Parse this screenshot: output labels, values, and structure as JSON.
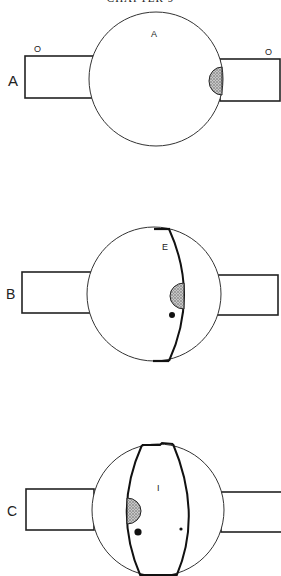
{
  "header": {
    "title": "CHAPTER 9"
  },
  "colors": {
    "ink": "#222222",
    "stipple": "#9a9a9a",
    "background": "#ffffff"
  },
  "figures": [
    {
      "id": "A",
      "panel_label": "A",
      "inner_label": "A",
      "left_rect_label": "O",
      "right_rect_label": "O",
      "description": "Globe with two rectangular muscle attachments; stippled semicircle on right edge"
    },
    {
      "id": "B",
      "panel_label": "B",
      "inner_label": "E",
      "description": "Globe with one curved boundary line, stippled semicircle and dot"
    },
    {
      "id": "C",
      "panel_label": "C",
      "inner_label": "I",
      "description": "Globe with two curved boundary lines forming lens shape, stippled semicircle, large and small dots"
    }
  ]
}
